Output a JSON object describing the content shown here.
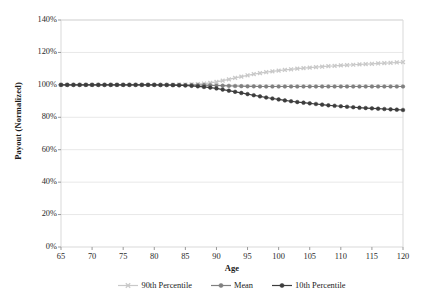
{
  "chart_data": {
    "type": "line",
    "title": "",
    "xlabel": "Age",
    "ylabel": "Payout (Normalized)",
    "xlim": [
      65,
      120
    ],
    "ylim": [
      0,
      1.4
    ],
    "xticks": [
      65,
      70,
      75,
      80,
      85,
      90,
      95,
      100,
      105,
      110,
      115,
      120
    ],
    "xtick_labels": [
      "65",
      "70",
      "75",
      "80",
      "85",
      "90",
      "95",
      "100",
      "105",
      "110",
      "115",
      "120"
    ],
    "yticks": [
      0,
      0.2,
      0.4,
      0.6,
      0.8,
      1.0,
      1.2,
      1.4
    ],
    "ytick_labels": [
      "0%",
      "20%",
      "40%",
      "60%",
      "80%",
      "100%",
      "120%",
      "140%"
    ],
    "grid": "horizontal",
    "legend_position": "bottom",
    "x": [
      65,
      66,
      67,
      68,
      69,
      70,
      71,
      72,
      73,
      74,
      75,
      76,
      77,
      78,
      79,
      80,
      81,
      82,
      83,
      84,
      85,
      86,
      87,
      88,
      89,
      90,
      91,
      92,
      93,
      94,
      95,
      96,
      97,
      98,
      99,
      100,
      101,
      102,
      103,
      104,
      105,
      106,
      107,
      108,
      109,
      110,
      111,
      112,
      113,
      114,
      115,
      116,
      117,
      118,
      119,
      120
    ],
    "series": [
      {
        "name": "90th Percentile",
        "color": "#c9c9c9",
        "marker": "x",
        "values": [
          1.0,
          1.0,
          1.0,
          1.0,
          1.0,
          1.0,
          1.0,
          1.0,
          1.0,
          1.0,
          1.0,
          1.0,
          1.0,
          1.0,
          1.0,
          1.0,
          1.0,
          1.0,
          1.0,
          1.001,
          1.002,
          1.003,
          1.005,
          1.008,
          1.012,
          1.018,
          1.026,
          1.034,
          1.043,
          1.051,
          1.059,
          1.066,
          1.072,
          1.078,
          1.083,
          1.088,
          1.092,
          1.096,
          1.1,
          1.103,
          1.106,
          1.109,
          1.112,
          1.115,
          1.117,
          1.12,
          1.122,
          1.124,
          1.126,
          1.128,
          1.13,
          1.132,
          1.134,
          1.136,
          1.138,
          1.14
        ]
      },
      {
        "name": "Mean",
        "color": "#808080",
        "marker": "o",
        "values": [
          1.0,
          1.0,
          1.0,
          1.0,
          1.0,
          1.0,
          1.0,
          1.0,
          1.0,
          1.0,
          1.0,
          1.0,
          1.0,
          1.0,
          1.0,
          1.0,
          1.0,
          1.0,
          1.0,
          1.0,
          0.999,
          0.999,
          0.999,
          0.998,
          0.997,
          0.996,
          0.995,
          0.994,
          0.993,
          0.992,
          0.991,
          0.991,
          0.99,
          0.99,
          0.99,
          0.99,
          0.99,
          0.99,
          0.99,
          0.99,
          0.99,
          0.99,
          0.99,
          0.99,
          0.99,
          0.99,
          0.99,
          0.99,
          0.99,
          0.99,
          0.99,
          0.99,
          0.99,
          0.99,
          0.99,
          0.99
        ]
      },
      {
        "name": "10th Percentile",
        "color": "#3d3d3d",
        "marker": "o",
        "values": [
          1.0,
          1.0,
          1.0,
          1.0,
          1.0,
          1.0,
          1.0,
          1.0,
          1.0,
          1.0,
          1.0,
          1.0,
          1.0,
          1.0,
          1.0,
          1.0,
          0.999,
          0.999,
          0.998,
          0.997,
          0.996,
          0.994,
          0.991,
          0.987,
          0.983,
          0.978,
          0.971,
          0.964,
          0.957,
          0.95,
          0.943,
          0.936,
          0.929,
          0.922,
          0.916,
          0.91,
          0.904,
          0.899,
          0.894,
          0.89,
          0.886,
          0.882,
          0.878,
          0.874,
          0.871,
          0.868,
          0.865,
          0.862,
          0.859,
          0.857,
          0.855,
          0.853,
          0.851,
          0.849,
          0.847,
          0.845
        ]
      }
    ]
  },
  "style": {
    "plot_border_color": "#d9d9d9",
    "grid_color": "#e8e8e8",
    "background": "#ffffff"
  }
}
